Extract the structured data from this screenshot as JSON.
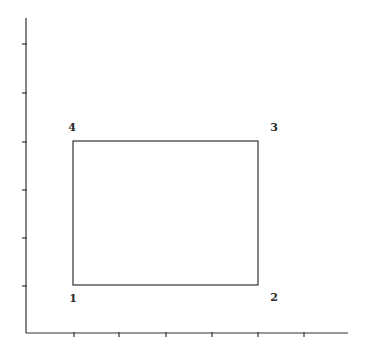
{
  "diagram": {
    "type": "coordinate-plot-rectangle",
    "axes": {
      "origin": [
        26,
        333
      ],
      "y_axis_top": 18,
      "x_axis_right": 348,
      "x_ticks_px": [
        74,
        119,
        166,
        212,
        258,
        304
      ],
      "y_ticks_px": [
        44,
        93,
        142,
        190,
        238,
        286
      ],
      "color": "#333333"
    },
    "rectangle": {
      "left": 73,
      "top": 141,
      "right": 258,
      "bottom": 285,
      "color": "#333333"
    },
    "corner_labels": [
      {
        "text": "1",
        "x": 73,
        "y": 298
      },
      {
        "text": "2",
        "x": 274,
        "y": 297
      },
      {
        "text": "3",
        "x": 274,
        "y": 127
      },
      {
        "text": "4",
        "x": 72,
        "y": 127
      }
    ]
  }
}
